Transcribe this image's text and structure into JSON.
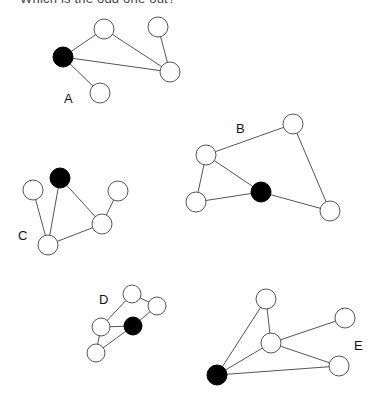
{
  "question": "Which is the odd one out?",
  "style": {
    "edge_color": "#555555",
    "open_node_fill": "#ffffff",
    "filled_node_color": "#000000"
  },
  "graphs": [
    {
      "label": "A",
      "label_pos": [
        64,
        103
      ],
      "radius": 10,
      "nodes": [
        {
          "id": "a0",
          "x": 63,
          "y": 57,
          "filled": true
        },
        {
          "id": "a1",
          "x": 104,
          "y": 29,
          "filled": false
        },
        {
          "id": "a2",
          "x": 158,
          "y": 27,
          "filled": false
        },
        {
          "id": "a3",
          "x": 170,
          "y": 72,
          "filled": false
        },
        {
          "id": "a4",
          "x": 100,
          "y": 93,
          "filled": false
        }
      ],
      "edges": [
        [
          "a0",
          "a1"
        ],
        [
          "a0",
          "a3"
        ],
        [
          "a0",
          "a4"
        ],
        [
          "a1",
          "a3"
        ],
        [
          "a2",
          "a3"
        ]
      ]
    },
    {
      "label": "B",
      "label_pos": [
        236,
        133
      ],
      "radius": 10,
      "nodes": [
        {
          "id": "b0",
          "x": 261,
          "y": 192,
          "filled": true
        },
        {
          "id": "b1",
          "x": 206,
          "y": 155,
          "filled": false
        },
        {
          "id": "b2",
          "x": 293,
          "y": 124,
          "filled": false
        },
        {
          "id": "b3",
          "x": 196,
          "y": 202,
          "filled": false
        },
        {
          "id": "b4",
          "x": 330,
          "y": 211,
          "filled": false
        }
      ],
      "edges": [
        [
          "b1",
          "b2"
        ],
        [
          "b1",
          "b3"
        ],
        [
          "b1",
          "b0"
        ],
        [
          "b3",
          "b0"
        ],
        [
          "b0",
          "b4"
        ],
        [
          "b2",
          "b4"
        ]
      ]
    },
    {
      "label": "C",
      "label_pos": [
        18,
        240
      ],
      "radius": 10,
      "nodes": [
        {
          "id": "c0",
          "x": 60,
          "y": 178,
          "filled": true
        },
        {
          "id": "c1",
          "x": 33,
          "y": 190,
          "filled": false
        },
        {
          "id": "c2",
          "x": 118,
          "y": 191,
          "filled": false
        },
        {
          "id": "c3",
          "x": 102,
          "y": 224,
          "filled": false
        },
        {
          "id": "c4",
          "x": 48,
          "y": 245,
          "filled": false
        }
      ],
      "edges": [
        [
          "c0",
          "c4"
        ],
        [
          "c0",
          "c3"
        ],
        [
          "c1",
          "c4"
        ],
        [
          "c4",
          "c3"
        ],
        [
          "c3",
          "c2"
        ]
      ]
    },
    {
      "label": "D",
      "label_pos": [
        99,
        304
      ],
      "radius": 9,
      "nodes": [
        {
          "id": "d0",
          "x": 133,
          "y": 326,
          "filled": true
        },
        {
          "id": "d1",
          "x": 132,
          "y": 294,
          "filled": false
        },
        {
          "id": "d2",
          "x": 157,
          "y": 306,
          "filled": false
        },
        {
          "id": "d3",
          "x": 101,
          "y": 327,
          "filled": false
        },
        {
          "id": "d4",
          "x": 96,
          "y": 353,
          "filled": false
        }
      ],
      "edges": [
        [
          "d1",
          "d2"
        ],
        [
          "d1",
          "d3"
        ],
        [
          "d2",
          "d0"
        ],
        [
          "d3",
          "d0"
        ],
        [
          "d3",
          "d4"
        ],
        [
          "d4",
          "d0"
        ]
      ]
    },
    {
      "label": "E",
      "label_pos": [
        354,
        350
      ],
      "radius": 10,
      "nodes": [
        {
          "id": "e0",
          "x": 217,
          "y": 375,
          "filled": true
        },
        {
          "id": "e1",
          "x": 266,
          "y": 299,
          "filled": false
        },
        {
          "id": "e2",
          "x": 271,
          "y": 343,
          "filled": false
        },
        {
          "id": "e3",
          "x": 345,
          "y": 318,
          "filled": false
        },
        {
          "id": "e4",
          "x": 339,
          "y": 366,
          "filled": false
        }
      ],
      "edges": [
        [
          "e0",
          "e1"
        ],
        [
          "e0",
          "e2"
        ],
        [
          "e0",
          "e4"
        ],
        [
          "e1",
          "e2"
        ],
        [
          "e2",
          "e3"
        ],
        [
          "e2",
          "e4"
        ]
      ]
    }
  ]
}
